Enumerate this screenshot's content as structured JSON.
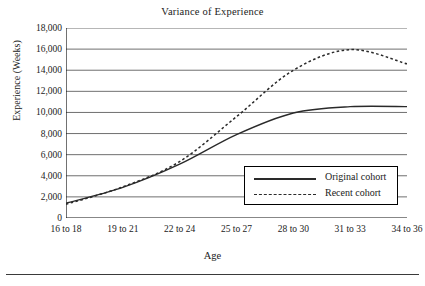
{
  "figure": {
    "title": "Variance of Experience",
    "bottom_rule": true
  },
  "axes": {
    "y_label": "Experience (Weeks)",
    "x_label": "Age",
    "y_ticks": [
      "18,000",
      "16,000",
      "14,000",
      "12,000",
      "10,000",
      "8,000",
      "6,000",
      "4,000",
      "2,000",
      "0"
    ]
  },
  "legend": {
    "items": [
      {
        "label": "Original cohort",
        "style": "solid",
        "key_name": "legend-key-solid"
      },
      {
        "label": "Recent cohort",
        "style": "dotted",
        "key_name": "legend-key-dotted"
      }
    ]
  },
  "chart_data": {
    "type": "line",
    "title": "Variance of Experience",
    "xlabel": "Age",
    "ylabel": "Experience (Weeks)",
    "categories": [
      "16 to 18",
      "19 to 21",
      "22 to 24",
      "25 to 27",
      "28 to 30",
      "31 to 33",
      "34 to 36"
    ],
    "ylim": [
      0,
      18000
    ],
    "ytick_step": 2000,
    "grid": "horizontal",
    "legend_position": "inside-lower-right",
    "series": [
      {
        "name": "Original cohort",
        "style": "solid",
        "color": "#2a2a2a",
        "values": [
          1400,
          2900,
          5100,
          7900,
          9950,
          10550,
          10550
        ]
      },
      {
        "name": "Recent cohort",
        "style": "dotted",
        "color": "#2a2a2a",
        "values": [
          1300,
          2950,
          5350,
          9600,
          14000,
          15950,
          14600
        ]
      }
    ]
  }
}
